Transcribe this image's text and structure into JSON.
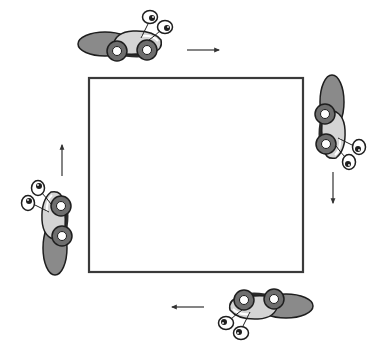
{
  "diagram": {
    "square": {
      "x": 89,
      "y": 78,
      "width": 214,
      "height": 194,
      "stroke": "#3a3a3a"
    },
    "colors": {
      "wheel_outer": "#6e6e6e",
      "wheel_inner": "#ffffff",
      "body_light": "#d4d4d4",
      "rear_dark": "#8a8a8a",
      "outline": "#1e1e1e",
      "shadow": "#2a2a2a",
      "arrow": "#333333"
    },
    "cars": [
      {
        "name": "car-top",
        "position": "top",
        "heading": "right"
      },
      {
        "name": "car-right",
        "position": "right",
        "heading": "down"
      },
      {
        "name": "car-bottom",
        "position": "bottom",
        "heading": "left"
      },
      {
        "name": "car-left",
        "position": "left",
        "heading": "up"
      }
    ],
    "arrows": [
      {
        "name": "arrow-right",
        "direction": "right"
      },
      {
        "name": "arrow-down",
        "direction": "down"
      },
      {
        "name": "arrow-left",
        "direction": "left"
      },
      {
        "name": "arrow-up",
        "direction": "up"
      }
    ]
  }
}
